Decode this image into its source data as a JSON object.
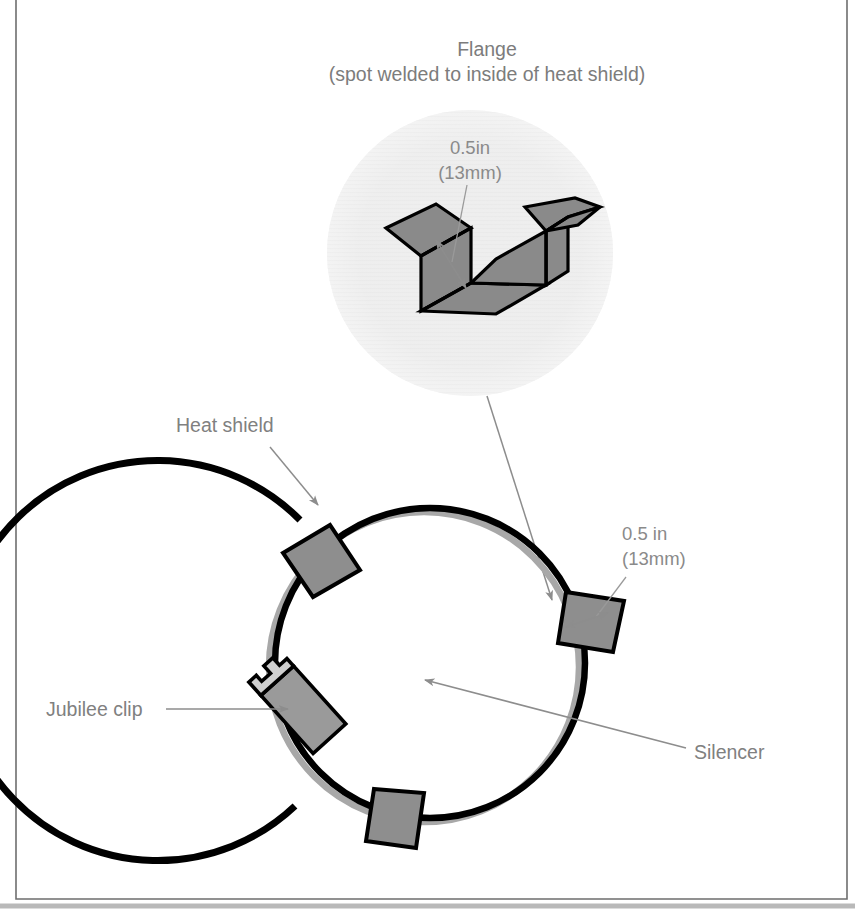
{
  "figure": {
    "detail": {
      "title_line1": "Flange",
      "title_line2": "(spot welded to inside of heat shield)",
      "dimension_line1": "0.5in",
      "dimension_line2": "(13mm)"
    },
    "assembly": {
      "label_heat_shield": "Heat shield",
      "label_jubilee_clip": "Jubilee clip",
      "label_silencer": "Silencer",
      "dimension_line1": "0.5 in",
      "dimension_line2": "(13mm)"
    },
    "colors": {
      "metal_fill": "#8e8e8e",
      "outline": "#000000",
      "label_text": "#808080",
      "leader": "#8d8d8d",
      "detail_circle_fill": "#eeeeee",
      "frame": "#6e6e6e",
      "silencer_shadow": "#a8a8a8",
      "clip_head": "#cfcfcf"
    },
    "icon_names": {
      "detail_callout": "magnify-detail-circle-icon",
      "dimension_arrow": "double-arrow-dimension-icon",
      "leader_arrow": "leader-arrow-icon"
    }
  }
}
